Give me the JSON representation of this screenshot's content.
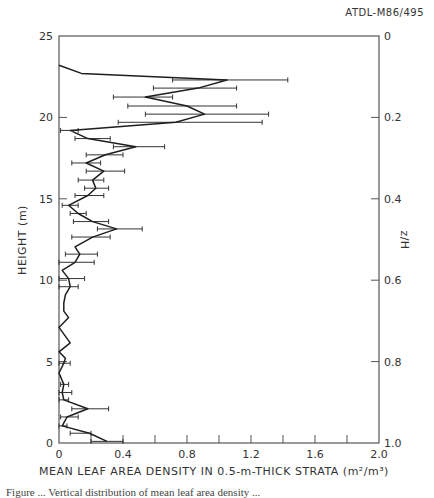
{
  "figure": {
    "code": "ATDL-M86/495",
    "caption_partial": "Figure ... Vertical distribution of mean leaf area density ..."
  },
  "chart_data": {
    "type": "line",
    "title": "",
    "xlabel": "MEAN LEAF AREA DENSITY IN 0.5-m-THICK STRATA (m²/m³)",
    "ylabel": "HEIGHT (m)",
    "y2label": "z/H",
    "xlim": [
      0,
      2.0
    ],
    "ylim": [
      0,
      25
    ],
    "y2lim": [
      1.0,
      0
    ],
    "x_ticks": [
      0,
      0.2,
      0.4,
      0.6,
      0.8,
      1.0,
      1.2,
      1.4,
      1.6,
      1.8,
      2.0
    ],
    "x_tick_labels": [
      "0",
      "0.4",
      "0.8",
      "1.2",
      "1.6",
      "2.0"
    ],
    "x_tick_label_values": [
      0,
      0.4,
      0.8,
      1.2,
      1.6,
      2.0
    ],
    "y_ticks": [
      0,
      5,
      10,
      15,
      20,
      25
    ],
    "y_tick_labels": [
      "0",
      "5",
      "10",
      "15",
      "20",
      "25"
    ],
    "y2_ticks": [
      0,
      0.2,
      0.4,
      0.6,
      0.8,
      1.0
    ],
    "y2_tick_labels": [
      "0",
      "0.2",
      "0.4",
      "0.6",
      "0.8",
      "1.0"
    ],
    "grid": false,
    "series": [
      {
        "name": "mean leaf area density",
        "points": [
          {
            "h": 23.2,
            "x": 0.0
          },
          {
            "h": 22.7,
            "x": 0.14
          },
          {
            "h": 22.3,
            "x": 1.05,
            "lo": 0.71,
            "hi": 1.43
          },
          {
            "h": 21.8,
            "x": 0.87,
            "lo": 0.59,
            "hi": 1.11
          },
          {
            "h": 21.25,
            "x": 0.54,
            "lo": 0.34,
            "hi": 0.71
          },
          {
            "h": 20.7,
            "x": 0.8,
            "lo": 0.43,
            "hi": 1.11
          },
          {
            "h": 20.2,
            "x": 0.91,
            "lo": 0.54,
            "hi": 1.31
          },
          {
            "h": 19.7,
            "x": 0.73,
            "lo": 0.37,
            "hi": 1.27
          },
          {
            "h": 19.2,
            "x": 0.07,
            "lo": 0.01,
            "hi": 0.12
          },
          {
            "h": 18.7,
            "x": 0.18,
            "lo": 0.1,
            "hi": 0.32
          },
          {
            "h": 18.2,
            "x": 0.48,
            "lo": 0.34,
            "hi": 0.66
          },
          {
            "h": 17.7,
            "x": 0.29,
            "lo": 0.17,
            "hi": 0.4
          },
          {
            "h": 17.2,
            "x": 0.17,
            "lo": 0.08,
            "hi": 0.26
          },
          {
            "h": 16.7,
            "x": 0.28,
            "lo": 0.17,
            "hi": 0.41
          },
          {
            "h": 16.15,
            "x": 0.21,
            "lo": 0.12,
            "hi": 0.28
          },
          {
            "h": 15.65,
            "x": 0.23,
            "lo": 0.16,
            "hi": 0.31
          },
          {
            "h": 15.2,
            "x": 0.18,
            "lo": 0.1,
            "hi": 0.28
          },
          {
            "h": 14.6,
            "x": 0.06,
            "lo": 0.02,
            "hi": 0.12
          },
          {
            "h": 14.1,
            "x": 0.12,
            "lo": 0.07,
            "hi": 0.17
          },
          {
            "h": 13.6,
            "x": 0.21,
            "lo": 0.09,
            "hi": 0.31
          },
          {
            "h": 13.15,
            "x": 0.36,
            "lo": 0.24,
            "hi": 0.52
          },
          {
            "h": 12.65,
            "x": 0.21,
            "lo": 0.08,
            "hi": 0.32
          },
          {
            "h": 12.05,
            "x": 0.1
          },
          {
            "h": 11.6,
            "x": 0.13,
            "lo": 0.04,
            "hi": 0.24
          },
          {
            "h": 11.1,
            "x": 0.1,
            "lo": 0.0,
            "hi": 0.22
          },
          {
            "h": 10.6,
            "x": 0.02
          },
          {
            "h": 10.1,
            "x": 0.06,
            "lo": 0.0,
            "hi": 0.16
          },
          {
            "h": 9.6,
            "x": 0.07,
            "lo": 0.0,
            "hi": 0.12
          },
          {
            "h": 9.1,
            "x": 0.04
          },
          {
            "h": 8.6,
            "x": 0.03
          },
          {
            "h": 8.1,
            "x": 0.03
          },
          {
            "h": 7.7,
            "x": 0.06
          },
          {
            "h": 7.1,
            "x": 0.0
          },
          {
            "h": 6.15,
            "x": 0.07
          },
          {
            "h": 5.6,
            "x": 0.0
          },
          {
            "h": 5.2,
            "x": 0.04
          },
          {
            "h": 4.9,
            "x": 0.03,
            "lo": 0.0,
            "hi": 0.07
          },
          {
            "h": 4.3,
            "x": 0.0
          },
          {
            "h": 3.6,
            "x": 0.03,
            "lo": 0.01,
            "hi": 0.06
          },
          {
            "h": 3.1,
            "x": 0.02,
            "lo": 0.0,
            "hi": 0.08
          },
          {
            "h": 2.65,
            "x": 0.03,
            "lo": 0.0,
            "hi": 0.06
          },
          {
            "h": 2.1,
            "x": 0.18,
            "lo": 0.08,
            "hi": 0.31
          },
          {
            "h": 1.6,
            "x": 0.05,
            "lo": 0.01,
            "hi": 0.12
          },
          {
            "h": 1.05,
            "x": 0.02,
            "lo": 0.0,
            "hi": 0.05
          },
          {
            "h": 0.6,
            "x": 0.19,
            "lo": 0.07,
            "hi": 0.2
          },
          {
            "h": 0.1,
            "x": 0.3,
            "lo": 0.2,
            "hi": 0.4
          }
        ]
      }
    ]
  },
  "colors": {
    "line": "#1e1e1e",
    "axis": "#555555",
    "text": "#333333",
    "background": "#ffffff"
  }
}
